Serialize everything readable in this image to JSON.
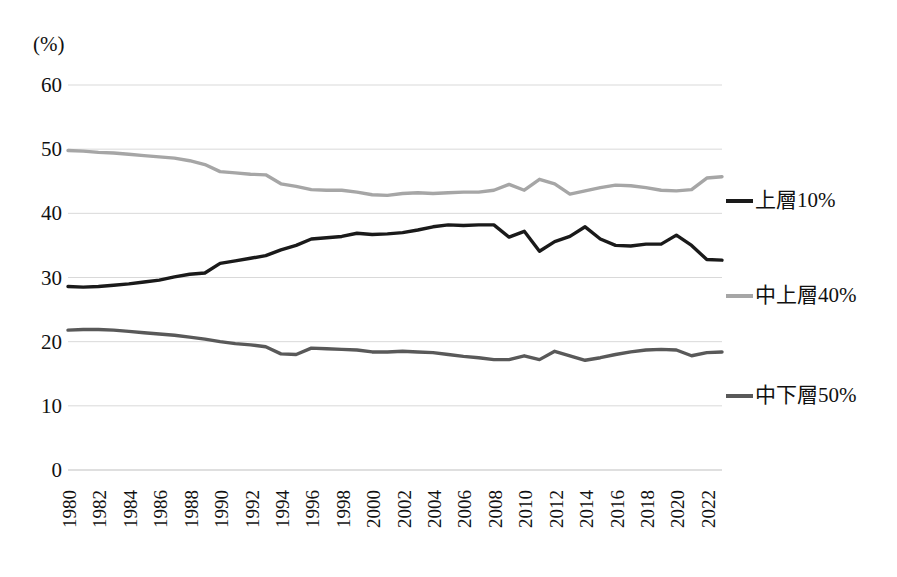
{
  "axis": {
    "unit_label": "(%)",
    "y_ticks": [
      "0",
      "10",
      "20",
      "30",
      "40",
      "50",
      "60"
    ],
    "x_ticks": [
      "1980",
      "1982",
      "1984",
      "1986",
      "1988",
      "1990",
      "1992",
      "1994",
      "1996",
      "1998",
      "2000",
      "2002",
      "2004",
      "2006",
      "2008",
      "2010",
      "2012",
      "2014",
      "2016",
      "2018",
      "2020",
      "2022"
    ]
  },
  "legend": {
    "items": [
      {
        "label": "上層10%",
        "color": "#1a1a1a"
      },
      {
        "label": "中上層40%",
        "color": "#a6a6a6"
      },
      {
        "label": "中下層50%",
        "color": "#595959"
      }
    ]
  },
  "colors": {
    "top10": "#1a1a1a",
    "middle40": "#a6a6a6",
    "bottom50": "#595959",
    "gridline": "#d9d9d9",
    "axis": "#bfbfbf",
    "text": "#111111",
    "background": "#ffffff"
  },
  "chart_data": {
    "type": "line",
    "title": "",
    "subtitle": "",
    "xlabel": "",
    "ylabel": "(%)",
    "ylim": [
      0,
      60
    ],
    "xlim": [
      1980,
      2023
    ],
    "ytick_step": 10,
    "xtick_step": 2,
    "grid": true,
    "legend_position": "right",
    "x": [
      1980,
      1981,
      1982,
      1983,
      1984,
      1985,
      1986,
      1987,
      1988,
      1989,
      1990,
      1991,
      1992,
      1993,
      1994,
      1995,
      1996,
      1997,
      1998,
      1999,
      2000,
      2001,
      2002,
      2003,
      2004,
      2005,
      2006,
      2007,
      2008,
      2009,
      2010,
      2011,
      2012,
      2013,
      2014,
      2015,
      2016,
      2017,
      2018,
      2019,
      2020,
      2021,
      2022,
      2023
    ],
    "series": [
      {
        "name": "上層10%",
        "color": "#1a1a1a",
        "values": [
          28.6,
          28.5,
          28.6,
          28.8,
          29.0,
          29.3,
          29.6,
          30.1,
          30.5,
          30.7,
          32.2,
          32.6,
          33.0,
          33.4,
          34.3,
          35.0,
          36.0,
          36.2,
          36.4,
          36.9,
          36.7,
          36.8,
          37.0,
          37.4,
          37.9,
          38.2,
          38.1,
          38.2,
          38.2,
          36.3,
          37.2,
          34.1,
          35.6,
          36.4,
          37.9,
          36.0,
          35.0,
          34.9,
          35.2,
          35.2,
          36.6,
          35.0,
          32.8,
          32.7
        ]
      },
      {
        "name": "中上層40%",
        "color": "#a6a6a6",
        "values": [
          49.8,
          49.7,
          49.5,
          49.4,
          49.2,
          49.0,
          48.8,
          48.6,
          48.2,
          47.6,
          46.5,
          46.3,
          46.1,
          46.0,
          44.6,
          44.2,
          43.7,
          43.6,
          43.6,
          43.3,
          42.9,
          42.8,
          43.1,
          43.2,
          43.1,
          43.2,
          43.3,
          43.3,
          43.6,
          44.5,
          43.6,
          45.3,
          44.6,
          43.0,
          43.5,
          44.0,
          44.4,
          44.3,
          44.0,
          43.6,
          43.5,
          43.7,
          45.5,
          45.7
        ]
      },
      {
        "name": "中下層50%",
        "color": "#595959",
        "values": [
          21.8,
          21.9,
          21.9,
          21.8,
          21.6,
          21.4,
          21.2,
          21.0,
          20.7,
          20.4,
          20.0,
          19.7,
          19.5,
          19.2,
          18.1,
          18.0,
          19.0,
          18.9,
          18.8,
          18.7,
          18.4,
          18.4,
          18.5,
          18.4,
          18.3,
          18.0,
          17.7,
          17.5,
          17.2,
          17.2,
          17.8,
          17.2,
          18.5,
          17.8,
          17.1,
          17.5,
          18.0,
          18.4,
          18.7,
          18.8,
          18.7,
          17.8,
          18.3,
          18.4
        ]
      }
    ]
  }
}
